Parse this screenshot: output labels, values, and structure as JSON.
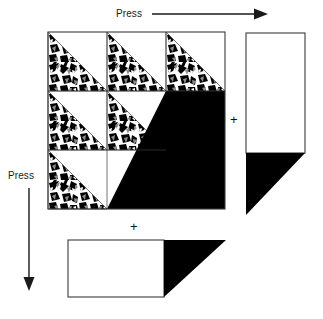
{
  "figure": {
    "type": "schematic-diagram",
    "width": 323,
    "height": 319,
    "background_color": "#ffffff"
  },
  "labels": {
    "top_press": "Press",
    "left_press": "Press",
    "plus_right": "+",
    "plus_bottom": "+"
  },
  "arrows": {
    "top": {
      "direction": "right",
      "name": "press-arrow-horizontal",
      "color": "#1a1a1a"
    },
    "left": {
      "direction": "down",
      "name": "press-arrow-vertical",
      "color": "#1a1a1a"
    }
  },
  "colors": {
    "outline": "#3a3a3a",
    "fill_solid": "#000000",
    "fill_empty": "#ffffff",
    "texture_dark": "#000000",
    "texture_mid": "#8a8a8a",
    "texture_light": "#ffffff"
  },
  "main_grid": {
    "name": "press-matrix",
    "rows": 3,
    "cols": 3,
    "x": 48,
    "y": 32,
    "cell_size": 59,
    "cells": [
      {
        "row": 0,
        "col": 0,
        "state": "textured-triangle"
      },
      {
        "row": 0,
        "col": 1,
        "state": "textured-triangle"
      },
      {
        "row": 0,
        "col": 2,
        "state": "textured-triangle"
      },
      {
        "row": 1,
        "col": 0,
        "state": "textured-triangle"
      },
      {
        "row": 1,
        "col": 1,
        "state": "textured-triangle"
      },
      {
        "row": 1,
        "col": 2,
        "state": "solid-black"
      },
      {
        "row": 2,
        "col": 0,
        "state": "textured-triangle"
      },
      {
        "row": 2,
        "col": 1,
        "state": "solid-black"
      },
      {
        "row": 2,
        "col": 2,
        "state": "solid-black"
      }
    ]
  },
  "right_panel": {
    "name": "right-column-bar",
    "rect": {
      "x": 246,
      "y": 33,
      "width": 59,
      "height": 120,
      "fill": "#ffffff"
    },
    "triangle": {
      "x": 246,
      "y": 153,
      "width": 59,
      "height": 62,
      "fill": "#000000"
    }
  },
  "bottom_panel": {
    "name": "bottom-row-bar",
    "rect": {
      "x": 68,
      "y": 240,
      "width": 96,
      "height": 57,
      "fill": "#ffffff"
    },
    "triangle": {
      "x": 164,
      "y": 240,
      "width": 62,
      "height": 57,
      "fill": "#000000"
    }
  }
}
